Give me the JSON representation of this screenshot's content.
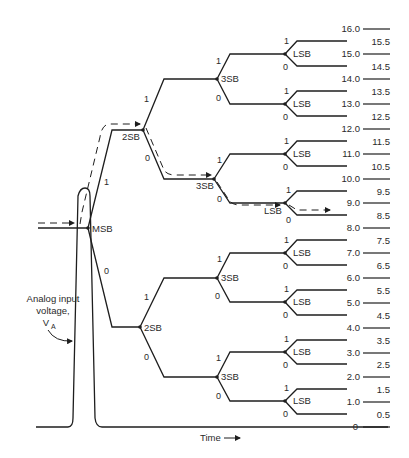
{
  "figure": {
    "type": "successive-approximation ADC binary search tree",
    "input_label": {
      "lines": [
        "Analog input",
        "voltage,",
        "V"
      ],
      "subscript": "A"
    },
    "time_label": "Time",
    "node_labels": {
      "msb": "MSB",
      "sb2": "2SB",
      "sb3": "3SB",
      "lsb": "LSB"
    },
    "branch_labels": {
      "one": "1",
      "zero": "0"
    },
    "scale": {
      "integer_levels": [
        "16.0",
        "15.0",
        "14.0",
        "13.0",
        "12.0",
        "11.0",
        "10.0",
        "9.0",
        "8.0",
        "7.0",
        "6.0",
        "5.0",
        "4.0",
        "3.0",
        "2.0",
        "1.0",
        "0"
      ],
      "half_levels": [
        "15.5",
        "14.5",
        "13.5",
        "12.5",
        "11.5",
        "10.5",
        "9.5",
        "8.5",
        "7.5",
        "6.5",
        "5.5",
        "4.5",
        "3.5",
        "2.5",
        "1.5",
        "0.5"
      ]
    },
    "highlighted_path": [
      "MSB=1",
      "2SB=0",
      "3SB=0",
      "LSB=1"
    ],
    "colors": {
      "ink": "#1e1e1e",
      "background": "#ffffff"
    }
  }
}
